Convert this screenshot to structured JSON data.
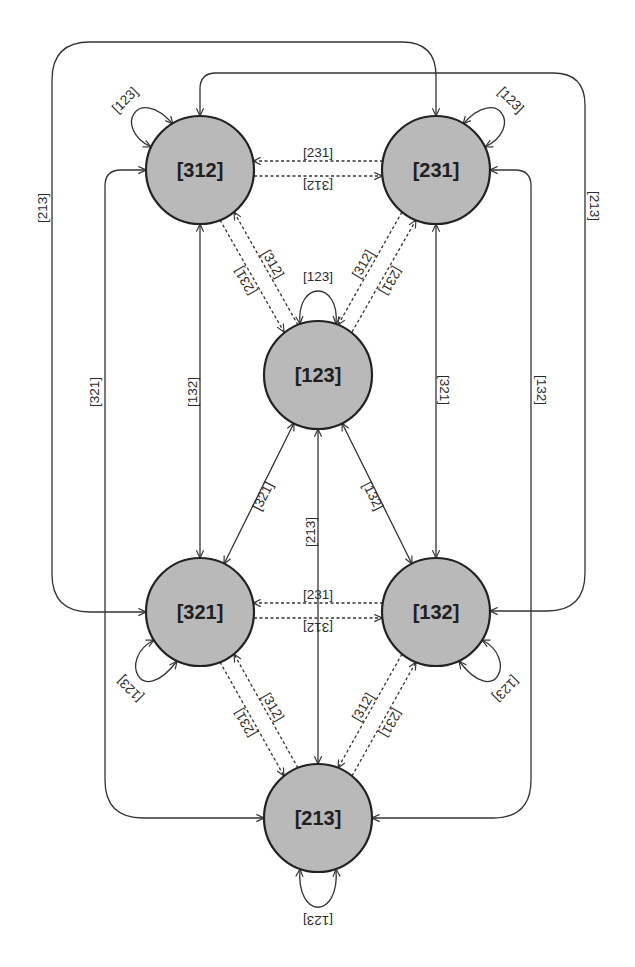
{
  "diagram": {
    "nodes": [
      {
        "id": "n312",
        "label": "[312]"
      },
      {
        "id": "n231",
        "label": "[231]"
      },
      {
        "id": "n123",
        "label": "[123]"
      },
      {
        "id": "n321",
        "label": "[321]"
      },
      {
        "id": "n132",
        "label": "[132]"
      },
      {
        "id": "n213",
        "label": "[213]"
      }
    ],
    "edges": [
      {
        "from": "[312]",
        "to": "[312]",
        "label": "[123]",
        "style": "solid",
        "type": "self-loop"
      },
      {
        "from": "[231]",
        "to": "[231]",
        "label": "[123]",
        "style": "solid",
        "type": "self-loop"
      },
      {
        "from": "[123]",
        "to": "[123]",
        "label": "[123]",
        "style": "solid",
        "type": "self-loop"
      },
      {
        "from": "[321]",
        "to": "[321]",
        "label": "[123]",
        "style": "solid",
        "type": "self-loop"
      },
      {
        "from": "[132]",
        "to": "[132]",
        "label": "[123]",
        "style": "solid",
        "type": "self-loop"
      },
      {
        "from": "[213]",
        "to": "[213]",
        "label": "[123]",
        "style": "solid",
        "type": "self-loop"
      },
      {
        "from": "[231]",
        "to": "[312]",
        "label": "[231]",
        "style": "dashed",
        "type": "directed"
      },
      {
        "from": "[312]",
        "to": "[231]",
        "label": "[312]",
        "style": "dashed",
        "type": "directed"
      },
      {
        "from": "[132]",
        "to": "[321]",
        "label": "[231]",
        "style": "dashed",
        "type": "directed"
      },
      {
        "from": "[321]",
        "to": "[132]",
        "label": "[312]",
        "style": "dashed",
        "type": "directed"
      },
      {
        "from": "[312]",
        "to": "[123]",
        "label": "[231]",
        "style": "dashed",
        "type": "directed"
      },
      {
        "from": "[123]",
        "to": "[312]",
        "label": "[312]",
        "style": "dashed",
        "type": "directed"
      },
      {
        "from": "[231]",
        "to": "[123]",
        "label": "[312]",
        "style": "dashed",
        "type": "directed"
      },
      {
        "from": "[123]",
        "to": "[231]",
        "label": "[231]",
        "style": "dashed",
        "type": "directed"
      },
      {
        "from": "[321]",
        "to": "[213]",
        "label": "[231]",
        "style": "dashed",
        "type": "directed"
      },
      {
        "from": "[213]",
        "to": "[321]",
        "label": "[312]",
        "style": "dashed",
        "type": "directed"
      },
      {
        "from": "[132]",
        "to": "[213]",
        "label": "[312]",
        "style": "dashed",
        "type": "directed"
      },
      {
        "from": "[213]",
        "to": "[132]",
        "label": "[231]",
        "style": "dashed",
        "type": "directed"
      },
      {
        "from": "[312]",
        "to": "[321]",
        "label": "[132]",
        "style": "solid",
        "type": "bidirectional"
      },
      {
        "from": "[231]",
        "to": "[132]",
        "label": "[321]",
        "style": "solid",
        "type": "bidirectional"
      },
      {
        "from": "[123]",
        "to": "[213]",
        "label": "[213]",
        "style": "solid",
        "type": "bidirectional"
      },
      {
        "from": "[123]",
        "to": "[321]",
        "label": "[321]",
        "style": "solid",
        "type": "bidirectional"
      },
      {
        "from": "[123]",
        "to": "[132]",
        "label": "[132]",
        "style": "solid",
        "type": "bidirectional"
      },
      {
        "from": "[321]",
        "to": "[231]",
        "label": "[213]",
        "style": "solid",
        "type": "bidirectional"
      },
      {
        "from": "[312]",
        "to": "[213]",
        "label": "[321]",
        "style": "solid",
        "type": "bidirectional"
      },
      {
        "from": "[312]",
        "to": "[132]",
        "label": "[213]",
        "style": "solid",
        "type": "bidirectional"
      },
      {
        "from": "[231]",
        "to": "[213]",
        "label": "[132]",
        "style": "solid",
        "type": "bidirectional"
      }
    ]
  },
  "colors": {
    "node_fill": "#b9b9b9",
    "node_stroke": "#222222",
    "edge_stroke": "#333333",
    "background": "#ffffff"
  }
}
